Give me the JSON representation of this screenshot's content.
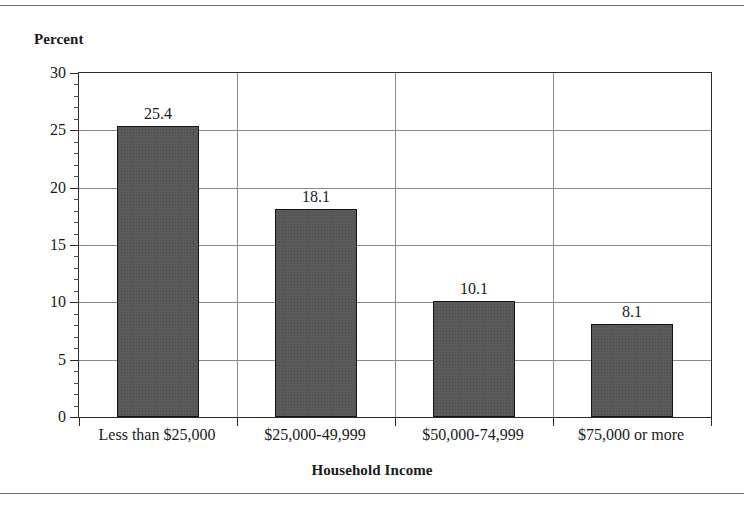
{
  "chart_data": {
    "type": "bar",
    "title": "",
    "xlabel": "Household Income",
    "ylabel": "Percent",
    "categories": [
      "Less than $25,000",
      "$25,000-49,999",
      "$50,000-74,999",
      "$75,000 or more"
    ],
    "values": [
      25.4,
      18.1,
      10.1,
      8.1
    ],
    "value_labels": [
      "25.4",
      "18.1",
      "10.1",
      "8.1"
    ],
    "ylim": [
      0,
      30
    ],
    "ytick_labels": [
      "0",
      "5",
      "10",
      "15",
      "20",
      "25",
      "30"
    ],
    "ytick_values": [
      0,
      5,
      10,
      15,
      20,
      25,
      30
    ],
    "minor_tick_step": 1,
    "grid": "horizontal-and-category-dividers",
    "legend": "none",
    "bar_color": "#5a5a5a",
    "bar_border_color": "#141414",
    "grid_color": "#8a8a8a",
    "axis_color": "#2b2b2b",
    "rule_color": "#6d6d6d"
  }
}
